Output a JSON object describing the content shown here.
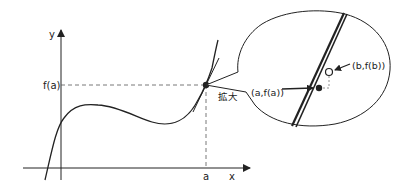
{
  "diagram": {
    "axes": {
      "x_label": "x",
      "y_label": "y",
      "x_tick_label": "a",
      "y_tick_label": "f(a)"
    },
    "zoom_label": "拡大",
    "inset": {
      "point_a_label": "(a,f(a))",
      "point_b_label": "(b,f(b))"
    },
    "colors": {
      "line": "#222222",
      "dashed": "#555555",
      "background": "#ffffff"
    }
  }
}
